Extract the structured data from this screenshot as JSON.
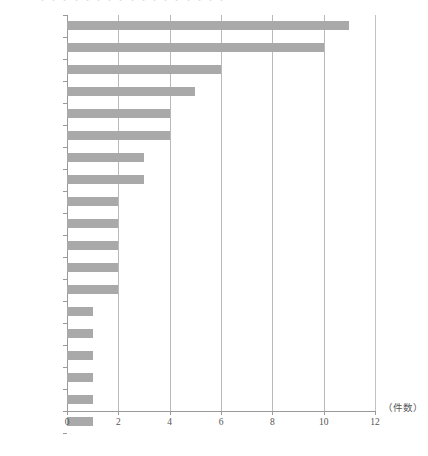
{
  "figure": {
    "cut_off_caption": "・・・・・・・・・・・・・・・・・",
    "unit_label": "（件数）"
  },
  "chart_data": {
    "type": "bar",
    "orientation": "horizontal",
    "title": "",
    "subtitle": "",
    "xlabel": "（件数）",
    "ylabel": "",
    "xlim": [
      0,
      12
    ],
    "xticks": [
      0,
      2,
      4,
      6,
      8,
      10,
      12
    ],
    "xtick_labels": [
      "0",
      "2",
      "4",
      "6",
      "8",
      "10",
      "12"
    ],
    "grid": true,
    "grid_axis": "x",
    "legend": false,
    "bar_color": "#a9a9a9",
    "axis_color": "#9a9a9a",
    "grid_color": "#b9b9b9",
    "categories": [
      "遅い",
      "かわいそう",
      "悪い",
      "だめ",
      "相手",
      "意地悪",
      "自分",
      "泣く",
      "悲しい",
      "言われた人",
      "言葉",
      "いけない",
      "頑張る",
      "大事",
      "仕方がない",
      "良くない",
      "嫌な気持ち",
      "お父さん",
      "一生懸命"
    ],
    "values": [
      11,
      10,
      6,
      5,
      4,
      4,
      3,
      3,
      2,
      2,
      2,
      2,
      2,
      1,
      1,
      1,
      1,
      1,
      1
    ]
  }
}
